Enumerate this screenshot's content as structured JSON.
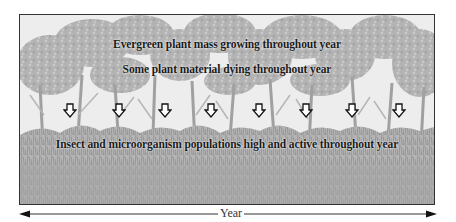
{
  "diagram": {
    "type": "tropical-rainforest-annual-cycle",
    "background_scene": "rainforest-trees-and-undergrowth",
    "labels": {
      "growth": "Evergreen plant mass growing throughout year",
      "dying": "Some plant material dying throughout year",
      "insects": "Insect and microorganism populations high and active throughout year"
    },
    "down_arrows": {
      "count": 8,
      "meaning": "plant material falling to forest floor",
      "x_positions": [
        43,
        92,
        138,
        184,
        232,
        279,
        325,
        372
      ]
    },
    "timeline": {
      "label": "Year",
      "direction": "bidirectional"
    },
    "colors": {
      "tree_canopy": "#a9a9a9",
      "undergrowth": "#9a9a9a",
      "frame_border": "#333333",
      "text": "#1a1a1a"
    }
  }
}
